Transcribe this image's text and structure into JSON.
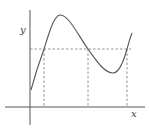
{
  "diagram": {
    "type": "function-graph",
    "axes": {
      "x_label": "x",
      "y_label": "y"
    },
    "curve": {
      "description": "cubic-like curve: rises from y-intercept to a local maximum, falls to a local minimum, then rises again",
      "color": "#555555"
    },
    "horizontal_line": {
      "style": "dashed",
      "intersections": 3
    },
    "vertical_drops": {
      "style": "dashed",
      "count": 3
    }
  }
}
